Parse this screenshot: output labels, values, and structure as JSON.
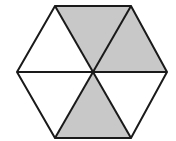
{
  "diagram": {
    "type": "hexagon-divided-into-triangles",
    "total_parts": 6,
    "shaded_parts": 3,
    "colors": {
      "shade": "#c8c8c8",
      "unshaded": "#ffffff",
      "stroke": "#1a1a1a"
    },
    "triangles": [
      {
        "position": "top",
        "shaded": true
      },
      {
        "position": "upper-right",
        "shaded": true
      },
      {
        "position": "lower-right",
        "shaded": false
      },
      {
        "position": "bottom",
        "shaded": true
      },
      {
        "position": "lower-left",
        "shaded": false
      },
      {
        "position": "upper-left",
        "shaded": false
      }
    ]
  }
}
